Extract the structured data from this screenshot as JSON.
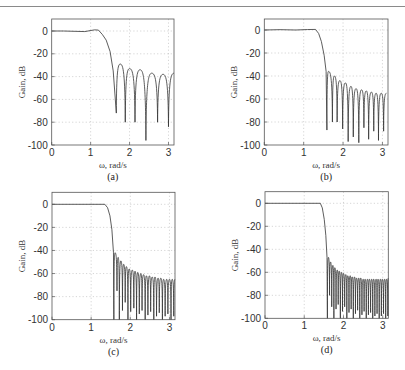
{
  "header": {
    "text": ""
  },
  "chart_data": [
    {
      "type": "line",
      "id": "a",
      "caption": "(a)",
      "xlabel": "ω, rad/s",
      "ylabel": "Gain, dB",
      "xlim": [
        0,
        3.1416
      ],
      "ylim": [
        -100,
        10
      ],
      "xticks": [
        0,
        1,
        2,
        3
      ],
      "yticks": [
        0,
        -20,
        -40,
        -60,
        -80,
        -100
      ],
      "grid": true,
      "box": {
        "left": 51.7,
        "top": 19,
        "right": 174,
        "y0": 31,
        "y100": 145
      },
      "passband": {
        "edge": 1.15,
        "ripple_points": [
          [
            0,
            0
          ],
          [
            0.3,
            0
          ],
          [
            0.6,
            -0.3
          ],
          [
            0.85,
            -0.5
          ],
          [
            1.1,
            1.0
          ],
          [
            1.2,
            0.8
          ]
        ]
      },
      "transition": [
        [
          1.2,
          0.8
        ],
        [
          1.3,
          -3
        ],
        [
          1.4,
          -8
        ],
        [
          1.5,
          -18
        ],
        [
          1.58,
          -35
        ],
        [
          1.66,
          -72
        ]
      ],
      "nulls": [
        [
          1.66,
          -72
        ],
        [
          1.89,
          -80
        ],
        [
          2.14,
          -80
        ],
        [
          2.42,
          -96
        ],
        [
          2.72,
          -80
        ],
        [
          3.0,
          -84
        ]
      ],
      "peaks": [
        [
          1.76,
          -29
        ],
        [
          2.0,
          -33
        ],
        [
          2.27,
          -34
        ],
        [
          2.57,
          -37
        ],
        [
          2.86,
          -38
        ],
        [
          3.1416,
          -37
        ]
      ]
    },
    {
      "type": "line",
      "id": "b",
      "caption": "(b)",
      "xlabel": "ω, rad/s",
      "ylabel": "Gain, dB",
      "xlim": [
        0,
        3.1416
      ],
      "ylim": [
        -100,
        10
      ],
      "xticks": [
        0,
        1,
        2,
        3
      ],
      "yticks": [
        0,
        -20,
        -40,
        -60,
        -80,
        -100
      ],
      "grid": true,
      "box": {
        "left": 264.3,
        "top": 19,
        "right": 388,
        "y0": 30,
        "y100": 145
      },
      "passband": {
        "edge": 1.3,
        "ripple_points": [
          [
            0,
            0
          ],
          [
            0.4,
            0.3
          ],
          [
            0.8,
            0
          ],
          [
            1.1,
            0.4
          ],
          [
            1.3,
            0.5
          ]
        ]
      },
      "transition": [
        [
          1.3,
          0.5
        ],
        [
          1.38,
          -3
        ],
        [
          1.45,
          -10
        ],
        [
          1.52,
          -22
        ],
        [
          1.57,
          -36
        ],
        [
          1.59,
          -87
        ]
      ],
      "nulls": [
        [
          1.59,
          -87
        ],
        [
          1.73,
          -80
        ],
        [
          1.85,
          -80
        ],
        [
          1.99,
          -86
        ],
        [
          2.13,
          -97
        ],
        [
          2.26,
          -93
        ],
        [
          2.4,
          -98
        ],
        [
          2.53,
          -85
        ],
        [
          2.65,
          -95
        ],
        [
          2.78,
          -88
        ],
        [
          2.9,
          -96
        ],
        [
          3.03,
          -88
        ]
      ],
      "peaks": [
        [
          1.63,
          -36
        ],
        [
          1.78,
          -40
        ],
        [
          1.92,
          -44
        ],
        [
          2.06,
          -46
        ],
        [
          2.2,
          -49
        ],
        [
          2.33,
          -51
        ],
        [
          2.47,
          -52
        ],
        [
          2.59,
          -53
        ],
        [
          2.72,
          -54
        ],
        [
          2.84,
          -55
        ],
        [
          2.97,
          -55
        ],
        [
          3.1,
          -55
        ]
      ]
    },
    {
      "type": "line",
      "id": "c",
      "caption": "(c)",
      "xlabel": "ω, rad/s",
      "ylabel": "Gain, dB",
      "xlim": [
        0,
        3.1416
      ],
      "ylim": [
        -100,
        10
      ],
      "xticks": [
        0,
        1,
        2,
        3
      ],
      "yticks": [
        0,
        -20,
        -40,
        -60,
        -80,
        -100
      ],
      "grid": true,
      "box": {
        "left": 52,
        "top": 192.3,
        "right": 175,
        "y0": 204.3,
        "y100": 319.7
      },
      "passband": {
        "edge": 1.35,
        "ripple_points": [
          [
            0,
            0
          ],
          [
            1.35,
            0
          ]
        ]
      },
      "transition": [
        [
          1.35,
          0
        ],
        [
          1.42,
          -3
        ],
        [
          1.48,
          -10
        ],
        [
          1.53,
          -22
        ],
        [
          1.57,
          -42
        ],
        [
          1.58,
          -100
        ]
      ],
      "nulls": [
        [
          1.58,
          -100
        ],
        [
          1.66,
          -75
        ],
        [
          1.72,
          -100
        ],
        [
          1.8,
          -92
        ],
        [
          1.87,
          -85
        ],
        [
          1.94,
          -100
        ],
        [
          2.01,
          -93
        ],
        [
          2.09,
          -90
        ],
        [
          2.16,
          -100
        ],
        [
          2.23,
          -95
        ],
        [
          2.3,
          -92
        ],
        [
          2.38,
          -100
        ],
        [
          2.45,
          -96
        ],
        [
          2.52,
          -93
        ],
        [
          2.6,
          -100
        ],
        [
          2.67,
          -97
        ],
        [
          2.74,
          -94
        ],
        [
          2.82,
          -100
        ],
        [
          2.89,
          -97
        ],
        [
          2.96,
          -95
        ],
        [
          3.04,
          -100
        ],
        [
          3.11,
          -97
        ]
      ],
      "peaks": [
        [
          1.61,
          -42
        ],
        [
          1.69,
          -46
        ],
        [
          1.76,
          -49
        ],
        [
          1.83,
          -52
        ],
        [
          1.9,
          -54
        ],
        [
          1.97,
          -56
        ],
        [
          2.05,
          -57
        ],
        [
          2.12,
          -58
        ],
        [
          2.19,
          -59
        ],
        [
          2.27,
          -60
        ],
        [
          2.34,
          -61
        ],
        [
          2.41,
          -62
        ],
        [
          2.49,
          -62
        ],
        [
          2.56,
          -63
        ],
        [
          2.63,
          -63
        ],
        [
          2.71,
          -64
        ],
        [
          2.78,
          -64
        ],
        [
          2.85,
          -65
        ],
        [
          2.93,
          -65
        ],
        [
          3.0,
          -65
        ],
        [
          3.07,
          -65
        ],
        [
          3.1416,
          -65
        ]
      ]
    },
    {
      "type": "line",
      "id": "d",
      "caption": "(d)",
      "xlabel": "ω, rad/s",
      "ylabel": "Gain, dB",
      "xlim": [
        0,
        3.1416
      ],
      "ylim": [
        -100,
        10
      ],
      "xticks": [
        0,
        1,
        2,
        3
      ],
      "yticks": [
        0,
        -20,
        -40,
        -60,
        -80,
        -100
      ],
      "grid": true,
      "box": {
        "left": 265,
        "top": 191.7,
        "right": 388.3,
        "y0": 203.3,
        "y100": 318.3
      },
      "passband": {
        "edge": 1.41,
        "ripple_points": [
          [
            0,
            0
          ],
          [
            1.41,
            0
          ]
        ]
      },
      "transition": [
        [
          1.41,
          0
        ],
        [
          1.46,
          -4
        ],
        [
          1.51,
          -14
        ],
        [
          1.55,
          -28
        ],
        [
          1.58,
          -47
        ],
        [
          1.59,
          -100
        ]
      ],
      "nulls": [
        [
          1.59,
          -100
        ],
        [
          1.645,
          -80
        ],
        [
          1.7,
          -90
        ],
        [
          1.755,
          -100
        ],
        [
          1.81,
          -92
        ],
        [
          1.865,
          -88
        ],
        [
          1.92,
          -100
        ],
        [
          1.975,
          -94
        ],
        [
          2.03,
          -90
        ],
        [
          2.085,
          -100
        ],
        [
          2.14,
          -95
        ],
        [
          2.195,
          -92
        ],
        [
          2.25,
          -100
        ],
        [
          2.305,
          -96
        ],
        [
          2.36,
          -93
        ],
        [
          2.415,
          -100
        ],
        [
          2.47,
          -97
        ],
        [
          2.525,
          -94
        ],
        [
          2.58,
          -100
        ],
        [
          2.635,
          -97
        ],
        [
          2.69,
          -95
        ],
        [
          2.745,
          -100
        ],
        [
          2.8,
          -98
        ],
        [
          2.855,
          -96
        ],
        [
          2.91,
          -100
        ],
        [
          2.965,
          -98
        ],
        [
          3.02,
          -96
        ],
        [
          3.075,
          -100
        ],
        [
          3.13,
          -98
        ]
      ],
      "peaks": [
        [
          1.615,
          -47
        ],
        [
          1.67,
          -51
        ],
        [
          1.73,
          -54
        ],
        [
          1.78,
          -56
        ],
        [
          1.84,
          -58
        ],
        [
          1.89,
          -59
        ],
        [
          1.95,
          -60
        ],
        [
          2.0,
          -61
        ],
        [
          2.06,
          -62
        ],
        [
          2.11,
          -63
        ],
        [
          2.17,
          -63
        ],
        [
          2.22,
          -64
        ],
        [
          2.28,
          -64
        ],
        [
          2.33,
          -65
        ],
        [
          2.39,
          -65
        ],
        [
          2.44,
          -65
        ],
        [
          2.5,
          -66
        ],
        [
          2.55,
          -66
        ],
        [
          2.61,
          -66
        ],
        [
          2.66,
          -66
        ],
        [
          2.72,
          -66
        ],
        [
          2.77,
          -66
        ],
        [
          2.83,
          -66
        ],
        [
          2.88,
          -66
        ],
        [
          2.94,
          -66
        ],
        [
          2.99,
          -66
        ],
        [
          3.05,
          -66
        ],
        [
          3.1,
          -66
        ],
        [
          3.1416,
          -65
        ]
      ]
    }
  ]
}
